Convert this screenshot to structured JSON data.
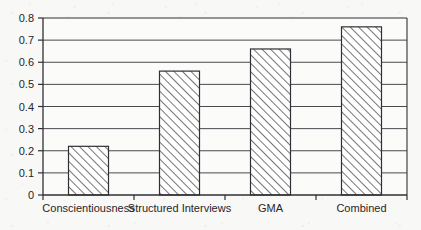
{
  "chart_data": {
    "type": "bar",
    "title": "",
    "subtitle": "",
    "xlabel": "",
    "ylabel": "",
    "categories": [
      "Conscientiousness",
      "Structured Interviews",
      "GMA",
      "Combined"
    ],
    "values": [
      0.22,
      0.56,
      0.66,
      0.76
    ],
    "series": [
      {
        "name": "Validity",
        "values": [
          0.22,
          0.56,
          0.66,
          0.76
        ]
      }
    ],
    "ylim": [
      0,
      0.8
    ],
    "ytick_labels": [
      "0",
      "0.1",
      "0.2",
      "0.3",
      "0.4",
      "0.5",
      "0.6",
      "0.7",
      "0.8"
    ],
    "ytick_values": [
      0,
      0.1,
      0.2,
      0.3,
      0.4,
      0.5,
      0.6,
      0.7,
      0.8
    ],
    "grid": true,
    "grid_axis": "y",
    "legend": false,
    "legend_position": "none",
    "bar_fill": "#ffffff",
    "bar_pattern": "diagonal-hatch",
    "bar_edge_color": "#303034",
    "axis_color": "#303034",
    "grid_color": "#4a4a4e",
    "plot_background": "#f8f8f6"
  },
  "axes": {
    "y_axis_name": "validity-axis",
    "x_axis_name": "predictor-axis"
  }
}
